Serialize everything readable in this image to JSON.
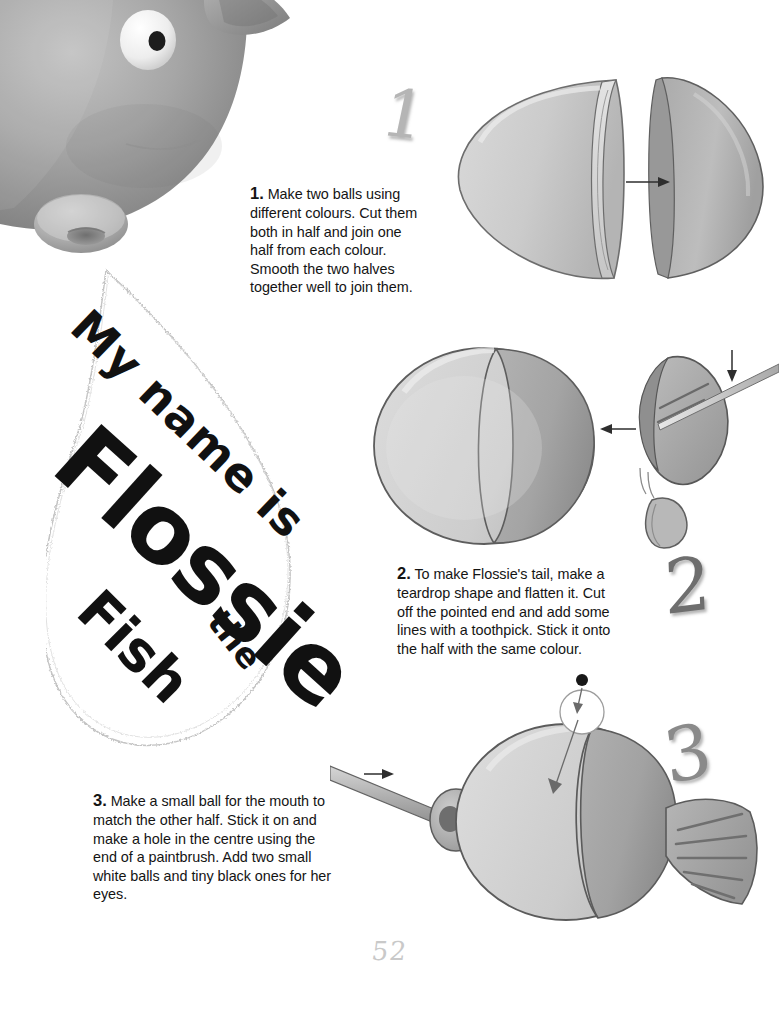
{
  "page": {
    "number": "52",
    "background": "#ffffff",
    "width": 779,
    "height": 1010
  },
  "photo": {
    "name": "flossie-fish-clay-model-photo",
    "description": "Grey clay fish head close-up with white eye, black pupil, rounded snout with mouth hole and a fin",
    "body_color": "#9a9a9a",
    "eye_white": "#f2f2f2",
    "pupil_color": "#1a1a1a"
  },
  "nametag": {
    "name": "flossie-name-tag",
    "shape": "scalloped-teardrop",
    "lines": [
      "My name is",
      "Flossie",
      "the",
      "Fish"
    ],
    "border_color": "#bdbdbd",
    "fill": "#ffffff"
  },
  "steps": [
    {
      "numeral": "1",
      "number_label": "1.",
      "text": "Make two balls using different colours. Cut them both in half and join one half from each colour. Smooth the two halves together well to join them.",
      "figure": "two-hemispheres-with-arrow"
    },
    {
      "numeral": "2",
      "number_label": "2.",
      "text": "To make Flossie's tail, make a teardrop shape and flatten it. Cut off the pointed end and add some lines with a toothpick. Stick it onto the half with the same colour.",
      "figure": "two-tone-ball-and-flattened-tail-with-toothpick"
    },
    {
      "numeral": "3",
      "number_label": "3.",
      "text": "Make a small ball for the mouth to match the other half. Stick it on and make a hole in the centre using the end of a paintbrush. Add two small white balls and tiny black ones for her eyes.",
      "figure": "finished-fish-with-paintbrush-tail-and-eye"
    }
  ],
  "colors": {
    "clay_light": "#d5d5d5",
    "clay_mid": "#b9b9b9",
    "clay_dark": "#9e9e9e",
    "clay_shadow": "#8a8a8a",
    "outline": "#4a4a4a",
    "arrow": "#3a3a3a",
    "text": "#141414",
    "numeral_light": "#b5b5b5",
    "numeral_dark": "#6e6e6e",
    "page_number": "#c9c9c9"
  }
}
